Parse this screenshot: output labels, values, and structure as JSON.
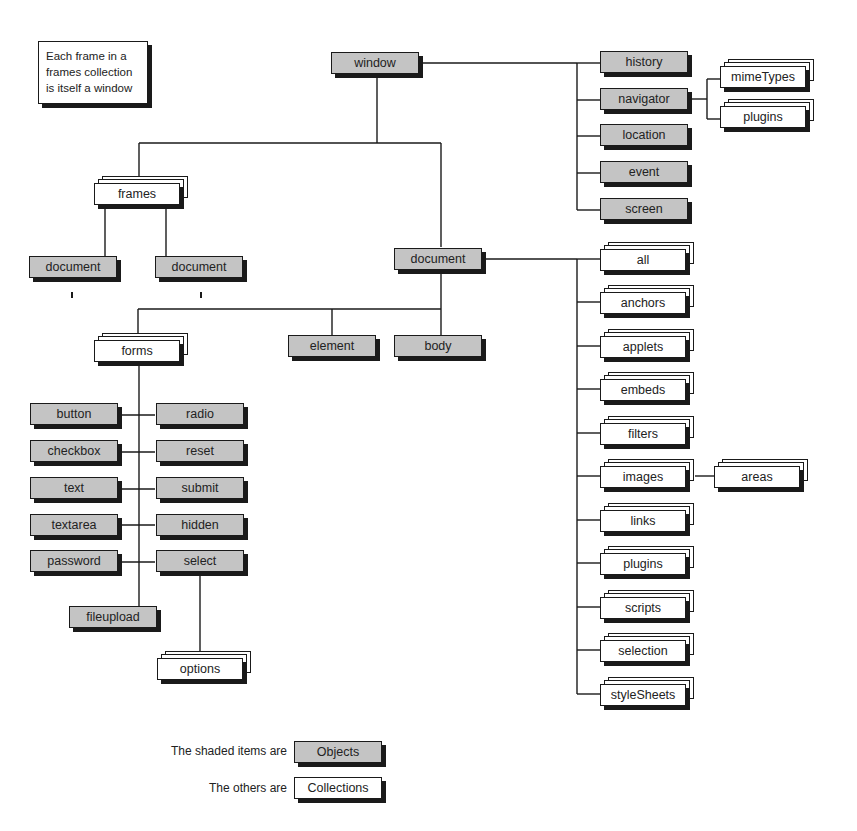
{
  "note": {
    "lines": [
      "Each frame in a",
      "frames collection",
      "is itself a window"
    ]
  },
  "nodes": {
    "window": {
      "label": "window",
      "type": "object"
    },
    "history": {
      "label": "history",
      "type": "object"
    },
    "navigator": {
      "label": "navigator",
      "type": "object"
    },
    "location": {
      "label": "location",
      "type": "object"
    },
    "event": {
      "label": "event",
      "type": "object"
    },
    "screen": {
      "label": "screen",
      "type": "object"
    },
    "mimeTypes": {
      "label": "mimeTypes",
      "type": "collection"
    },
    "nav_plugins": {
      "label": "plugins",
      "type": "collection"
    },
    "frames": {
      "label": "frames",
      "type": "collection"
    },
    "frame_document_1": {
      "label": "document",
      "type": "object"
    },
    "frame_document_2": {
      "label": "document",
      "type": "object"
    },
    "document": {
      "label": "document",
      "type": "object"
    },
    "all": {
      "label": "all",
      "type": "collection"
    },
    "anchors": {
      "label": "anchors",
      "type": "collection"
    },
    "applets": {
      "label": "applets",
      "type": "collection"
    },
    "embeds": {
      "label": "embeds",
      "type": "collection"
    },
    "filters": {
      "label": "filters",
      "type": "collection"
    },
    "images": {
      "label": "images",
      "type": "collection"
    },
    "areas": {
      "label": "areas",
      "type": "collection"
    },
    "links": {
      "label": "links",
      "type": "collection"
    },
    "doc_plugins": {
      "label": "plugins",
      "type": "collection"
    },
    "scripts": {
      "label": "scripts",
      "type": "collection"
    },
    "selection": {
      "label": "selection",
      "type": "collection"
    },
    "styleSheets": {
      "label": "styleSheets",
      "type": "collection"
    },
    "forms": {
      "label": "forms",
      "type": "collection"
    },
    "element": {
      "label": "element",
      "type": "object"
    },
    "body": {
      "label": "body",
      "type": "object"
    },
    "button": {
      "label": "button",
      "type": "object"
    },
    "radio": {
      "label": "radio",
      "type": "object"
    },
    "checkbox": {
      "label": "checkbox",
      "type": "object"
    },
    "reset": {
      "label": "reset",
      "type": "object"
    },
    "text": {
      "label": "text",
      "type": "object"
    },
    "submit": {
      "label": "submit",
      "type": "object"
    },
    "textarea": {
      "label": "textarea",
      "type": "object"
    },
    "hidden": {
      "label": "hidden",
      "type": "object"
    },
    "password": {
      "label": "password",
      "type": "object"
    },
    "select": {
      "label": "select",
      "type": "object"
    },
    "fileupload": {
      "label": "fileupload",
      "type": "object"
    },
    "options": {
      "label": "options",
      "type": "collection"
    }
  },
  "legend": {
    "objects_text": "The shaded items are",
    "objects_label": "Objects",
    "collections_text": "The others are",
    "collections_label": "Collections"
  },
  "colors": {
    "object_fill": "#c4c4c4",
    "collection_fill": "#ffffff",
    "line": "#1a1a1a"
  }
}
